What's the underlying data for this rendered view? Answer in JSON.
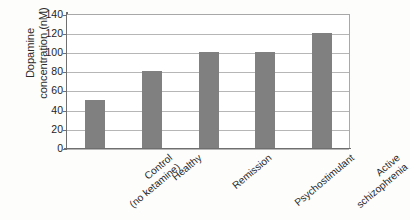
{
  "chart_data": {
    "type": "bar",
    "title": "",
    "xlabel": "",
    "ylabel": "Dopamine concentration (nM)",
    "ylabel_lines": [
      "Dopamine",
      "concentration (nM)"
    ],
    "categories": [
      "Control (no ketamine)",
      "Healthy",
      "Remission",
      "Psychostimulant",
      "Active schizophrenia"
    ],
    "category_lines": [
      [
        "Control",
        "(no ketamine)"
      ],
      [
        "Healthy"
      ],
      [
        "Remission"
      ],
      [
        "Psychostimulant"
      ],
      [
        "Active",
        "schizophrenia"
      ]
    ],
    "values": [
      50,
      80,
      100,
      100,
      120
    ],
    "ylim": [
      0,
      140
    ],
    "yticks": [
      0,
      20,
      40,
      60,
      80,
      100,
      120,
      140
    ],
    "ytick_labels": [
      "0",
      "20",
      "40",
      "60",
      "80",
      "100",
      "120",
      "140"
    ],
    "grid": true,
    "legend": false,
    "bar_color": "#808080",
    "gridline_color": "#b6b6b6",
    "axis_color": "#6f6f6f",
    "plot_background": "#ffffff"
  }
}
